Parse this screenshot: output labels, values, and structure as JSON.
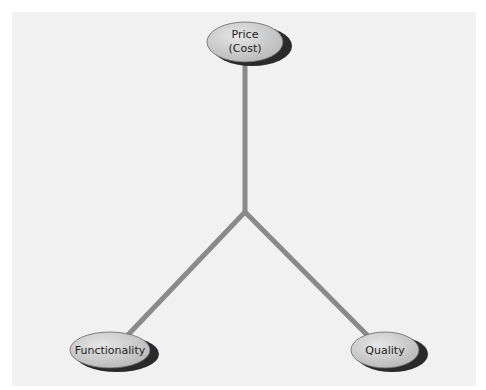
{
  "diagram": {
    "type": "triangle-tradeoff",
    "nodes": [
      {
        "id": "price",
        "line1": "Price",
        "line2": "(Cost)"
      },
      {
        "id": "functionality",
        "line1": "Functionality"
      },
      {
        "id": "quality",
        "line1": "Quality"
      }
    ],
    "colors": {
      "panel": "#f1f1f1",
      "connector": "#8a8a8a",
      "ellipse_fill": "#c8c8c8",
      "ellipse_shadow": "#2a2a2a"
    }
  }
}
